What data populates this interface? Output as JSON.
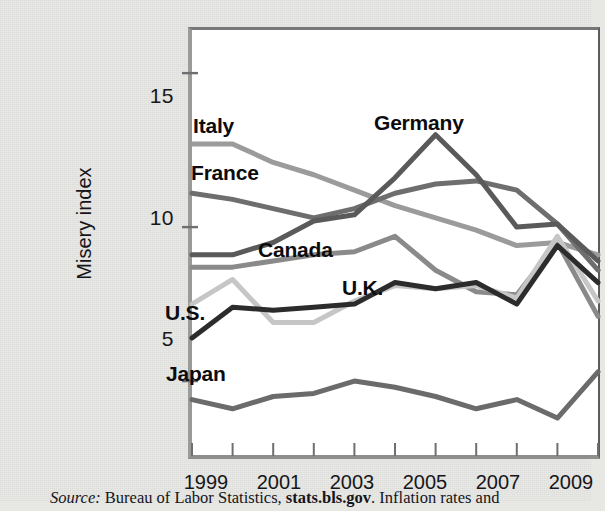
{
  "figure": {
    "ylabel": "Misery index",
    "source_prefix": "Source:",
    "source_mid": " Bureau of Labor Statistics, ",
    "source_bold": "stats.bls.gov",
    "source_suffix": ". Inflation rates and"
  },
  "axis": {
    "yticks": [
      "15",
      "10",
      "5"
    ],
    "xticks": [
      "1999",
      "2001",
      "2003",
      "2005",
      "2007",
      "2009"
    ]
  },
  "labels": {
    "italy": "Italy",
    "france": "France",
    "germany": "Germany",
    "canada": "Canada",
    "uk": "U.K.",
    "us": "U.S.",
    "japan": "Japan"
  },
  "chart_data": {
    "type": "line",
    "title": "",
    "xlabel": "",
    "ylabel": "Misery index",
    "xlim": [
      1999,
      2009
    ],
    "ylim": [
      2.6,
      16.4
    ],
    "yticks": [
      5,
      10,
      15
    ],
    "xticks": [
      1999,
      2000,
      2001,
      2002,
      2003,
      2004,
      2005,
      2006,
      2007,
      2008,
      2009
    ],
    "xtick_labels_shown": [
      1999,
      2001,
      2003,
      2005,
      2007,
      2009
    ],
    "grid": false,
    "legend": "inline-annotations",
    "x": [
      1999,
      2000,
      2001,
      2002,
      2003,
      2004,
      2005,
      2006,
      2007,
      2008,
      2009
    ],
    "series": [
      {
        "name": "Italy",
        "color": "#9b9b9b",
        "values": [
          12.7,
          12.7,
          12.1,
          11.7,
          11.2,
          10.7,
          10.3,
          9.9,
          9.4,
          9.5,
          9.1
        ]
      },
      {
        "name": "France",
        "color": "#6e6e6e",
        "values": [
          11.1,
          10.9,
          10.6,
          10.3,
          10.6,
          11.1,
          11.4,
          11.5,
          11.2,
          10.1,
          8.6
        ]
      },
      {
        "name": "Germany",
        "color": "#5a5a5a",
        "values": [
          9.1,
          9.1,
          9.5,
          10.2,
          10.4,
          11.6,
          13.0,
          11.7,
          10.0,
          10.1,
          8.9
        ]
      },
      {
        "name": "Canada",
        "color": "#8a8a8a",
        "values": [
          8.7,
          8.7,
          8.9,
          9.1,
          9.2,
          9.7,
          8.6,
          7.9,
          7.8,
          9.5,
          7.1
        ]
      },
      {
        "name": "U.K.",
        "color": "#c6c6c6",
        "values": [
          7.5,
          8.3,
          6.9,
          6.9,
          7.6,
          8.1,
          8.0,
          8.1,
          7.7,
          9.7,
          7.6
        ]
      },
      {
        "name": "U.S.",
        "color": "#2c2c2c",
        "values": [
          6.4,
          7.4,
          7.3,
          7.4,
          7.5,
          8.2,
          8.0,
          8.2,
          7.5,
          9.4,
          8.2
        ]
      },
      {
        "name": "Japan",
        "color": "#6b6b6b",
        "values": [
          4.4,
          4.1,
          4.5,
          4.6,
          5.0,
          4.8,
          4.5,
          4.1,
          4.4,
          3.8,
          5.3
        ]
      }
    ],
    "annotations": [
      {
        "text": "Italy",
        "x": 1999.2,
        "y": 13.6
      },
      {
        "text": "France",
        "x": 1999.15,
        "y": 12.0
      },
      {
        "text": "Germany",
        "x": 2004.1,
        "y": 13.9
      },
      {
        "text": "Canada",
        "x": 2001.6,
        "y": 8.9
      },
      {
        "text": "U.K.",
        "x": 2003.3,
        "y": 7.0
      },
      {
        "text": "U.S.",
        "x": 1999.05,
        "y": 6.1
      },
      {
        "text": "Japan",
        "x": 1999.05,
        "y": 3.5
      }
    ]
  }
}
